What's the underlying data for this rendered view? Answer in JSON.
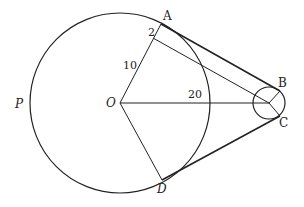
{
  "diagram": {
    "points": {
      "A": "A",
      "B": "B",
      "C": "C",
      "D": "D",
      "O": "O",
      "P": "P"
    },
    "lengths": {
      "small_segment": "2",
      "radius_segment": "10",
      "center_distance": "20"
    },
    "colors": {
      "stroke": "#222222",
      "background": "#ffffff"
    }
  }
}
